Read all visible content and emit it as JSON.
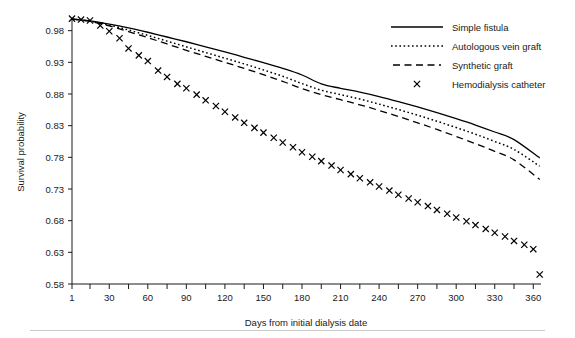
{
  "chart_data": {
    "type": "line",
    "title": "",
    "xlabel": "Days from initial dialysis date",
    "ylabel": "Survival probability",
    "xlim": [
      1,
      366
    ],
    "ylim": [
      0.58,
      1.0
    ],
    "grid": false,
    "legend_position": "top-right",
    "x_ticks_major": [
      1,
      30,
      60,
      90,
      120,
      150,
      180,
      210,
      240,
      270,
      300,
      330,
      360
    ],
    "x_tick_labels": [
      "1",
      "30",
      "60",
      "90",
      "120",
      "150",
      "180",
      "210",
      "240",
      "270",
      "300",
      "330",
      "360"
    ],
    "x_ticks_minor": [
      15,
      45,
      75,
      105,
      135,
      165,
      195,
      225,
      255,
      285,
      315,
      345
    ],
    "y_ticks": [
      0.58,
      0.63,
      0.68,
      0.73,
      0.78,
      0.83,
      0.88,
      0.93,
      0.98
    ],
    "y_tick_labels": [
      "0.58",
      "0.63",
      "0.68",
      "0.73",
      "0.78",
      "0.83",
      "0.88",
      "0.93",
      "0.98"
    ],
    "x": [
      1,
      15,
      30,
      45,
      60,
      75,
      90,
      105,
      120,
      135,
      150,
      165,
      180,
      195,
      210,
      225,
      240,
      255,
      270,
      285,
      300,
      315,
      330,
      345,
      365
    ],
    "series": [
      {
        "name": "Simple fistula",
        "style": "solid",
        "values": [
          0.9985,
          0.9955,
          0.9905,
          0.9845,
          0.9775,
          0.97,
          0.9625,
          0.9545,
          0.9465,
          0.938,
          0.9295,
          0.9205,
          0.91,
          0.896,
          0.889,
          0.883,
          0.876,
          0.868,
          0.8595,
          0.8505,
          0.841,
          0.831,
          0.82,
          0.808,
          0.779
        ]
      },
      {
        "name": "Autologous vein graft",
        "style": "dotted",
        "values": [
          0.9985,
          0.995,
          0.989,
          0.981,
          0.9725,
          0.9635,
          0.9545,
          0.9455,
          0.9365,
          0.9275,
          0.918,
          0.908,
          0.8965,
          0.886,
          0.879,
          0.872,
          0.864,
          0.8555,
          0.8465,
          0.837,
          0.827,
          0.8165,
          0.805,
          0.7925,
          0.766
        ]
      },
      {
        "name": "Synthetic graft",
        "style": "dashed",
        "values": [
          0.9985,
          0.9945,
          0.9875,
          0.9785,
          0.969,
          0.959,
          0.949,
          0.9395,
          0.93,
          0.9205,
          0.9105,
          0.9,
          0.8885,
          0.879,
          0.871,
          0.863,
          0.854,
          0.8445,
          0.8345,
          0.824,
          0.813,
          0.8015,
          0.7895,
          0.776,
          0.745
        ]
      },
      {
        "name": "Hemodialysis catheter",
        "style": "marker-x",
        "values": [
          0.9985,
          0.996,
          0.982,
          0.95,
          0.935,
          0.913,
          0.9,
          0.883,
          0.8705,
          0.8565,
          0.844,
          0.831,
          0.819,
          0.807,
          0.796,
          0.788,
          0.778,
          0.769,
          0.761,
          0.751,
          0.742,
          0.732,
          0.724,
          0.715,
          0.706
        ]
      }
    ],
    "catheter_extra": {
      "x": [
        1,
        8,
        15,
        23,
        30,
        38,
        45,
        53,
        60,
        68,
        75,
        83,
        90,
        98,
        105,
        113,
        120,
        128,
        135,
        143,
        150,
        158,
        165,
        173,
        180,
        188,
        195,
        203,
        210,
        218,
        225,
        233,
        240,
        248,
        255,
        263,
        270,
        278,
        285,
        293,
        300,
        308,
        315,
        323,
        330,
        338,
        345,
        353,
        360,
        365
      ],
      "y": [
        0.999,
        0.9975,
        0.996,
        0.988,
        0.979,
        0.968,
        0.952,
        0.941,
        0.932,
        0.917,
        0.907,
        0.896,
        0.889,
        0.879,
        0.87,
        0.861,
        0.852,
        0.843,
        0.8345,
        0.8265,
        0.819,
        0.811,
        0.8035,
        0.796,
        0.788,
        0.781,
        0.774,
        0.767,
        0.76,
        0.7535,
        0.747,
        0.7405,
        0.734,
        0.7275,
        0.721,
        0.715,
        0.709,
        0.703,
        0.697,
        0.691,
        0.685,
        0.679,
        0.673,
        0.667,
        0.661,
        0.655,
        0.648,
        0.642,
        0.635,
        0.595
      ]
    }
  },
  "legend": {
    "items": [
      {
        "label": "Simple fistula",
        "style": "solid"
      },
      {
        "label": "Autologous vein graft",
        "style": "dotted"
      },
      {
        "label": "Synthetic graft",
        "style": "dashed"
      },
      {
        "label": "Hemodialysis catheter",
        "style": "marker-x"
      }
    ]
  },
  "colors": {
    "ink": "#000000",
    "axis": "#1a1a1a",
    "background": "#ffffff",
    "rule": "#c9c9c9"
  }
}
